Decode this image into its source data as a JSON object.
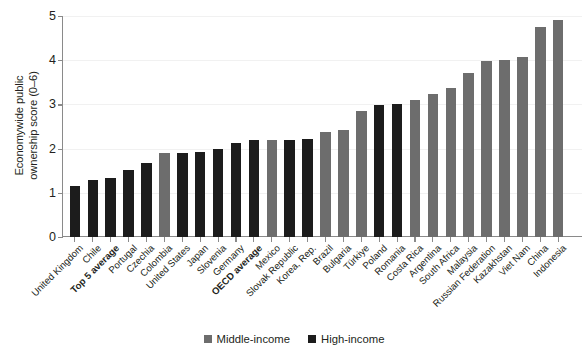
{
  "chart_data": {
    "type": "bar",
    "title": "",
    "xlabel": "",
    "ylabel": "Economywide public\nownership score (0–6)",
    "ylim": [
      0,
      5
    ],
    "yticks": [
      0,
      1,
      2,
      3,
      4,
      5
    ],
    "ytick_labels": [
      "0",
      "1",
      "2",
      "3",
      "4",
      "5"
    ],
    "grid": true,
    "legend_position": "bottom-center",
    "categories": [
      "United Kingdom",
      "Chile",
      "Top 5 average",
      "Portugal",
      "Czechia",
      "Colombia",
      "United States",
      "Japan",
      "Slovenia",
      "Germany",
      "OECD average",
      "Mexico",
      "Slovak Republic",
      "Korea, Rep.",
      "Brazil",
      "Bulgaria",
      "Türkiye",
      "Poland",
      "Romania",
      "Costa Rica",
      "Argentina",
      "South Africa",
      "Malaysia",
      "Russian Federation",
      "Kazakhstan",
      "Viet Nam",
      "China",
      "Indonesia"
    ],
    "values": [
      1.15,
      1.3,
      1.33,
      1.52,
      1.68,
      1.9,
      1.91,
      1.92,
      1.98,
      2.13,
      2.19,
      2.2,
      2.2,
      2.21,
      2.37,
      2.43,
      2.84,
      2.99,
      3.02,
      3.11,
      3.23,
      3.38,
      3.7,
      3.99,
      4.0,
      4.08,
      4.75,
      4.9
    ],
    "groups": [
      "High-income",
      "High-income",
      "High-income",
      "High-income",
      "High-income",
      "Middle-income",
      "High-income",
      "High-income",
      "High-income",
      "High-income",
      "High-income",
      "Middle-income",
      "High-income",
      "High-income",
      "Middle-income",
      "Middle-income",
      "Middle-income",
      "High-income",
      "High-income",
      "Middle-income",
      "Middle-income",
      "Middle-income",
      "Middle-income",
      "Middle-income",
      "Middle-income",
      "Middle-income",
      "Middle-income",
      "Middle-income"
    ],
    "bold_categories": [
      "Top 5 average",
      "OECD average"
    ],
    "series": [
      {
        "name": "Middle-income",
        "color": "#6d6d6d"
      },
      {
        "name": "High-income",
        "color": "#1c1c1c"
      }
    ]
  },
  "legend": {
    "items": [
      {
        "label": "Middle-income",
        "color": "#6d6d6d"
      },
      {
        "label": "High-income",
        "color": "#1c1c1c"
      }
    ]
  },
  "colors": {
    "middle_income": "#6d6d6d",
    "high_income": "#1c1c1c",
    "axis": "#8a8a8a",
    "grid": "#f1f1f1",
    "text": "#231f20"
  }
}
